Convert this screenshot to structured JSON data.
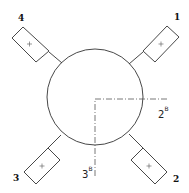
{
  "diagram": {
    "circle": {
      "cx": 95,
      "cy": 97,
      "r": 48
    },
    "ports": [
      {
        "id": "1",
        "label": "1",
        "symbol": "+",
        "position": "top-right"
      },
      {
        "id": "2",
        "label": "2",
        "symbol": "+",
        "position": "bottom-right"
      },
      {
        "id": "3",
        "label": "3",
        "symbol": "+",
        "position": "bottom-left"
      },
      {
        "id": "4",
        "label": "4",
        "symbol": "+",
        "position": "top-left"
      }
    ],
    "axes": [
      {
        "id": "2B",
        "base": "2",
        "superscript": "B",
        "direction": "horizontal-right"
      },
      {
        "id": "3B",
        "base": "3",
        "superscript": "B",
        "direction": "vertical-down"
      }
    ]
  }
}
